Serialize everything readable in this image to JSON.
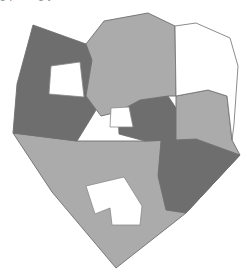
{
  "figure": {
    "clipped_caption_text": "g p   f   m g y",
    "background_color": "#ffffff",
    "width": 247,
    "height": 274
  },
  "palette": {
    "dark_gray": "#6e6e6e",
    "light_gray": "#ababab",
    "white": "#ffffff",
    "outline": "#6e6e6e",
    "hole_outline": "#8a8a8a"
  },
  "regions": [
    {
      "id": "region-northwest",
      "label": "Northwest parcel",
      "fill": "#6e6e6e",
      "tone": "dark",
      "has_hole": true,
      "hole_label": "Northwest courtyard void"
    },
    {
      "id": "region-north-central",
      "label": "North central parcel",
      "fill": "#ababab",
      "tone": "light",
      "has_hole": false
    },
    {
      "id": "region-northeast",
      "label": "Northeast parcel",
      "fill": "#ffffff",
      "tone": "white",
      "has_hole": false
    },
    {
      "id": "region-east",
      "label": "East parcel",
      "fill": "#ababab",
      "tone": "light",
      "has_hole": false
    },
    {
      "id": "region-central-east",
      "label": "Central east parcel",
      "fill": "#6e6e6e",
      "tone": "dark",
      "has_hole": false
    },
    {
      "id": "region-southeast",
      "label": "Southeast parcel",
      "fill": "#6e6e6e",
      "tone": "dark",
      "has_hole": false
    },
    {
      "id": "region-south",
      "label": "South parcel",
      "fill": "#ababab",
      "tone": "light",
      "has_hole": true,
      "hole_label": "South building footprint void"
    },
    {
      "id": "region-center-notch",
      "label": "Center notch void",
      "fill": "#ffffff",
      "tone": "white",
      "has_hole": false
    }
  ]
}
